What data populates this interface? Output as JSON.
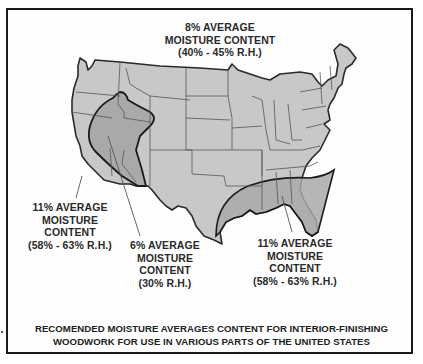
{
  "figure": {
    "type": "thematic-map",
    "colors": {
      "frame": "#1a1a1a",
      "land_fill": "#c8c8c8",
      "zone_fill": "#a9a9a9",
      "state_lines": "#555555",
      "zone_outline": "#1a1a1a",
      "text": "#2a2a2a"
    }
  },
  "regions": [
    {
      "id": "general",
      "lines": [
        "8% AVERAGE",
        "MOISTURE CONTENT",
        "(40% - 45% R.H.)"
      ]
    },
    {
      "id": "west-coast",
      "lines": [
        "11% AVERAGE",
        "MOISTURE",
        "CONTENT",
        "(58% - 63% R.H.)"
      ]
    },
    {
      "id": "southwest",
      "lines": [
        "6% AVERAGE",
        "MOISTURE",
        "CONTENT",
        "(30% R.H.)"
      ]
    },
    {
      "id": "southeast",
      "lines": [
        "11% AVERAGE",
        "MOISTURE",
        "CONTENT",
        "(58% - 63% R.H.)"
      ]
    }
  ],
  "caption": {
    "line1": "RECOMENDED MOISTURE AVERAGES CONTENT FOR INTERIOR-FINISHING",
    "line2": "WOODWORK FOR USE IN VARIOUS PARTS OF THE UNITED STATES"
  }
}
